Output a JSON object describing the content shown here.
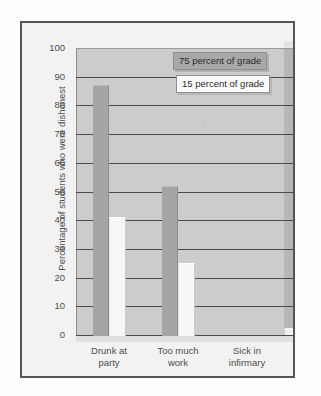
{
  "figure": {
    "alt_title": "Percentage of students who were dishonest by excuse and grade weight"
  },
  "chart_data": {
    "type": "bar",
    "title": "",
    "xlabel": "",
    "ylabel": "Percentage of students who were dishonest",
    "ylim": [
      0,
      100
    ],
    "ytick_labels": [
      "100",
      "90",
      "80",
      "70",
      "60",
      "50",
      "40",
      "30",
      "20",
      "10",
      "0"
    ],
    "ytick_values": [
      100,
      90,
      80,
      70,
      60,
      50,
      40,
      30,
      20,
      10,
      0
    ],
    "grid": true,
    "legend_position": "upper-right",
    "categories": [
      "Drunk at party",
      "Too much work",
      "Sick in infirmary"
    ],
    "category_lines": [
      [
        "Drunk at",
        "party"
      ],
      [
        "Too much",
        "work"
      ],
      [
        "Sick in",
        "infirmary"
      ]
    ],
    "series": [
      {
        "name": "75 percent of grade",
        "color": "#a5a5a5",
        "values": [
          87,
          52,
          0
        ]
      },
      {
        "name": "15 percent of grade",
        "color": "#f7f7f7",
        "values": [
          41,
          25,
          0
        ]
      }
    ]
  }
}
